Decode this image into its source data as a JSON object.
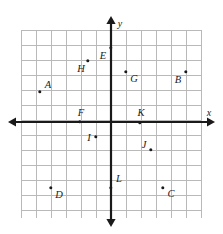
{
  "figure": {
    "type": "coordinate-plane",
    "background_color": "#ffffff",
    "grid_color": "#b9b9b9",
    "axis_color": "#1a1a1a",
    "point_color": "#1a1a1a"
  },
  "axes": {
    "x_label": "x",
    "y_label": "y",
    "x_label_px": {
      "x": 209,
      "y": 113
    },
    "y_label_px": {
      "x": 120,
      "y": 24
    },
    "origin_px": {
      "x": 111,
      "y": 122
    },
    "grid_spacing_px": 15,
    "x_arrow_left_px": 8,
    "x_arrow_right_px": 215,
    "y_arrow_top_px": 16,
    "y_arrow_bottom_px": 227,
    "x_range": [
      -6.7,
      6.0
    ],
    "y_range": [
      -7.0,
      4.9
    ],
    "grid_left_px": 21,
    "grid_right_px": 201,
    "grid_top_px": 30,
    "grid_bottom_px": 218,
    "grid_vertical_count": 13,
    "grid_horizontal_count": 13
  },
  "chart_data": {
    "type": "scatter",
    "xlabel": "x",
    "ylabel": "y",
    "grid": true,
    "legend": "none",
    "xlim": [
      -6.7,
      6.0
    ],
    "ylim": [
      -7.0,
      4.9
    ],
    "points": [
      {
        "label": "A",
        "x": -4.7,
        "y": 2.0,
        "px": 40,
        "py": 92,
        "lx": 48,
        "ly": 85
      },
      {
        "label": "B",
        "x": 5.0,
        "y": 3.3,
        "px": 186,
        "py": 72,
        "lx": 178,
        "ly": 80
      },
      {
        "label": "C",
        "x": 3.5,
        "y": -4.4,
        "px": 163,
        "py": 188,
        "lx": 171,
        "ly": 194
      },
      {
        "label": "D",
        "x": -4.0,
        "y": -4.4,
        "px": 51,
        "py": 188,
        "lx": 59,
        "ly": 195
      },
      {
        "label": "E",
        "x": 0.0,
        "y": 5.0,
        "px": 111,
        "py": 48,
        "lx": 103,
        "ly": 56
      },
      {
        "label": "F",
        "x": -2.0,
        "y": 0.0,
        "px": 80,
        "py": 122,
        "lx": 81,
        "ly": 113
      },
      {
        "label": "G",
        "x": 1.0,
        "y": 3.3,
        "px": 126,
        "py": 72,
        "lx": 134,
        "ly": 79
      },
      {
        "label": "H",
        "x": -1.5,
        "y": 4.0,
        "px": 88,
        "py": 61,
        "lx": 81,
        "ly": 69
      },
      {
        "label": "I",
        "x": -1.0,
        "y": -1.0,
        "px": 96,
        "py": 137,
        "lx": 89,
        "ly": 138
      },
      {
        "label": "J",
        "x": 2.7,
        "y": -1.9,
        "px": 151,
        "py": 150,
        "lx": 144,
        "ly": 145
      },
      {
        "label": "K",
        "x": 2.0,
        "y": 0.0,
        "px": 140,
        "py": 123,
        "lx": 141,
        "ly": 113
      },
      {
        "label": "L",
        "x": 0.0,
        "y": -4.4,
        "px": 111,
        "py": 188,
        "lx": 119,
        "ly": 179
      }
    ]
  }
}
